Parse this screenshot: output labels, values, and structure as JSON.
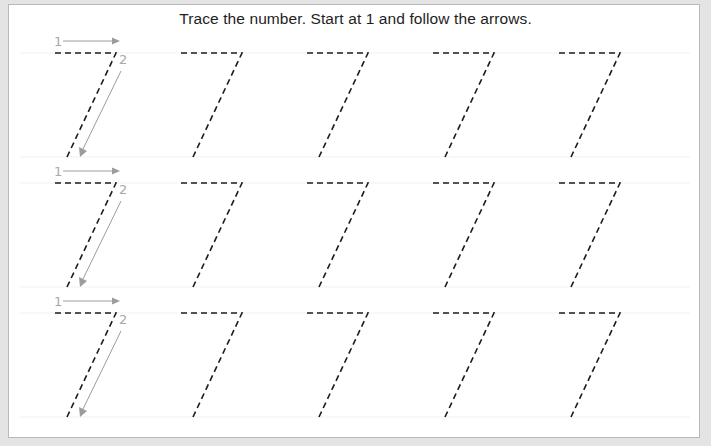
{
  "worksheet": {
    "title": "Trace the number. Start at 1 and follow the arrows.",
    "digit": "7",
    "rows": 3,
    "figures_per_row": 5,
    "step_labels": [
      "1",
      "2"
    ],
    "colors": {
      "background": "#e4e4e4",
      "card": "#ffffff",
      "dashed_stroke": "#1c1c1c",
      "arrow_stroke": "#9c9c9c",
      "text": "#1e1e1e"
    }
  }
}
